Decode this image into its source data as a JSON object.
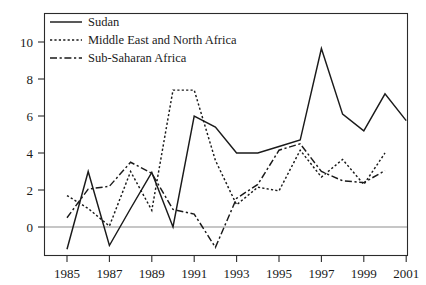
{
  "chart_data": {
    "type": "line",
    "title": "",
    "subtitle": "",
    "xlabel": "",
    "ylabel": "",
    "xlim": [
      1985,
      2001
    ],
    "ylim": [
      -1.6,
      11.2
    ],
    "grid": false,
    "legend_position": "top-left",
    "y_ticks": [
      0,
      2,
      4,
      6,
      8,
      10
    ],
    "y_tick_labels": [
      "0",
      "2",
      "4",
      "6",
      "8",
      "10"
    ],
    "x_ticks": [
      1985,
      1987,
      1989,
      1991,
      1993,
      1995,
      1997,
      1999,
      2001
    ],
    "x_tick_labels": [
      "1985",
      "1987",
      "1989",
      "1991",
      "1993",
      "1995",
      "1997",
      "1999",
      "2001"
    ],
    "zero_reference_line": 0,
    "x": [
      1985,
      1986,
      1987,
      1988,
      1989,
      1990,
      1991,
      1992,
      1993,
      1994,
      1995,
      1996,
      1997,
      1998,
      1999,
      2000,
      2001
    ],
    "series": [
      {
        "name": "Sudan",
        "style": "solid",
        "color": "#1a1a1a",
        "x": [
          1985,
          1986,
          1987,
          1988,
          1989,
          1990,
          1991,
          1992,
          1993,
          1994,
          1995,
          1996,
          1997,
          1998,
          1999,
          2000,
          2001
        ],
        "values": [
          -1.2,
          3.0,
          -1.0,
          1.0,
          2.95,
          0.0,
          6.0,
          5.4,
          4.0,
          4.0,
          4.35,
          4.7,
          9.65,
          6.1,
          5.2,
          7.2,
          5.75
        ]
      },
      {
        "name": "Middle East and North Africa",
        "style": "dotted",
        "color": "#1a1a1a",
        "x": [
          1985,
          1986,
          1987,
          1988,
          1989,
          1990,
          1991,
          1992,
          1993,
          1994,
          1995,
          1996,
          1997,
          1998,
          1999,
          2000
        ],
        "values": [
          1.7,
          1.0,
          0.05,
          3.0,
          0.9,
          7.4,
          7.4,
          3.6,
          1.2,
          2.15,
          1.95,
          4.15,
          2.7,
          3.65,
          2.3,
          4.0
        ]
      },
      {
        "name": "Sub-Saharan Africa",
        "style": "dash-dot",
        "color": "#1a1a1a",
        "x": [
          1985,
          1986,
          1987,
          1988,
          1989,
          1990,
          1991,
          1992,
          1993,
          1994,
          1995,
          1996,
          1997,
          1998,
          1999,
          2000
        ],
        "values": [
          0.5,
          2.05,
          2.2,
          3.5,
          2.9,
          0.95,
          0.7,
          -1.1,
          1.55,
          2.3,
          4.15,
          4.5,
          3.0,
          2.5,
          2.4,
          3.05
        ]
      }
    ]
  },
  "legend": {
    "entries": [
      {
        "label": "Sudan",
        "style": "solid"
      },
      {
        "label": "Middle East and North Africa",
        "style": "dotted"
      },
      {
        "label": "Sub-Saharan Africa",
        "style": "dash-dot"
      }
    ]
  },
  "axes": {
    "y_labels": [
      "10",
      "8",
      "6",
      "4",
      "2",
      "0"
    ],
    "x_labels": [
      "1985",
      "1987",
      "1989",
      "1991",
      "1993",
      "1995",
      "1997",
      "1999",
      "2001"
    ]
  }
}
